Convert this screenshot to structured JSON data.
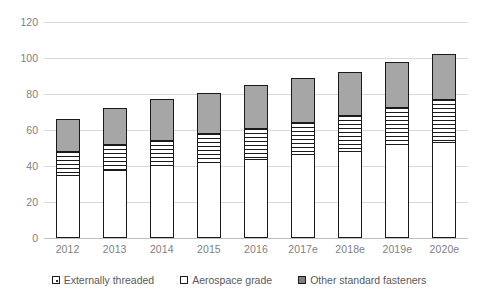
{
  "chart_data": {
    "type": "bar",
    "stacked": true,
    "title": "",
    "subtitle": "",
    "xlabel": "",
    "ylabel": "",
    "categories": [
      "2012",
      "2013",
      "2014",
      "2015",
      "2016",
      "2017e",
      "2018e",
      "2019e",
      "2020e"
    ],
    "series": [
      {
        "name": "Externally threaded",
        "pattern": "dotted",
        "color": "#ffffff",
        "values": [
          35,
          38,
          40.5,
          42,
          44,
          46.5,
          48.5,
          52,
          53.5
        ]
      },
      {
        "name": "Aerospace grade",
        "pattern": "horizontal-lines",
        "color": "#ffffff",
        "values": [
          13.5,
          14.5,
          14,
          16.5,
          17,
          18,
          20,
          21,
          23.5
        ]
      },
      {
        "name": "Other standard fasteners",
        "pattern": "solid",
        "color": "#a6a6a6",
        "values": [
          17.5,
          20,
          22.5,
          22,
          24,
          24.5,
          24,
          25,
          25
        ]
      }
    ],
    "totals": [
      66,
      72.5,
      77,
      80.5,
      85,
      89,
      92.5,
      98,
      102
    ],
    "ylim": [
      0,
      120
    ],
    "yticks": [
      0,
      20,
      40,
      60,
      80,
      100,
      120
    ],
    "ytick_labels": [
      "0",
      "20",
      "40",
      "60",
      "80",
      "100",
      "120"
    ],
    "grid": true,
    "grid_axis": "y",
    "legend_position": "bottom"
  },
  "axis": {
    "y_tick_labels": [
      "120",
      "100",
      "80",
      "60",
      "40",
      "20",
      "0"
    ]
  },
  "legend": {
    "items": [
      {
        "label": "Externally threaded"
      },
      {
        "label": "Aerospace grade"
      },
      {
        "label": "Other standard fasteners"
      }
    ]
  },
  "colors": {
    "gridline": "#d9d9d9",
    "axis_text": "#7f7f7f",
    "legend_text": "#595959",
    "series_other_standard": "#a6a6a6",
    "outline": "#1a1a1a",
    "background": "#ffffff"
  }
}
